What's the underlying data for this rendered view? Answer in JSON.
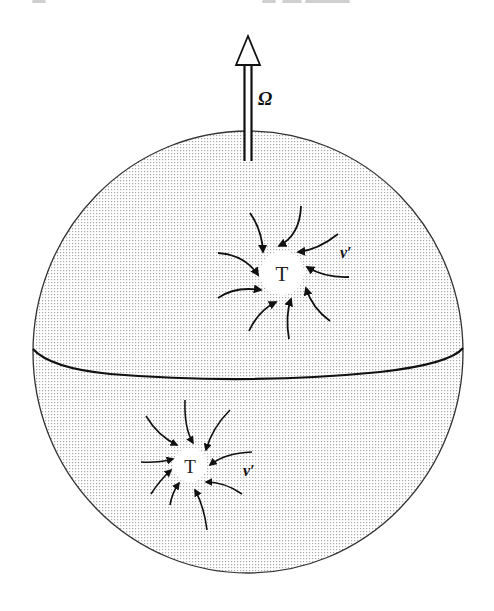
{
  "figure": {
    "rotation_label": "Ω",
    "upper_vortex": {
      "center_label": "T",
      "velocity_label": "v′"
    },
    "lower_vortex": {
      "center_label": "T",
      "velocity_label": "v′"
    },
    "colors": {
      "outline": "#333333",
      "stroke": "#111111",
      "dot_fill": "#a8a8a8",
      "background": "#ffffff",
      "core_fill": "#ffffff"
    }
  }
}
